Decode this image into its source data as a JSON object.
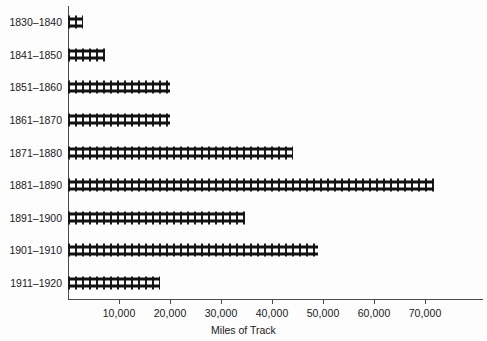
{
  "chart_data": {
    "type": "bar",
    "orientation": "horizontal",
    "title": "",
    "xlabel": "Miles of Track",
    "ylabel": "",
    "categories": [
      "1830–1840",
      "1841–1850",
      "1851–1860",
      "1861–1870",
      "1871–1880",
      "1881–1890",
      "1891–1900",
      "1901–1910",
      "1911–1920"
    ],
    "values": [
      3000,
      7250,
      20000,
      20000,
      44100,
      71800,
      34700,
      49000,
      18000
    ],
    "xlim": [
      0,
      77000
    ],
    "xticks": [
      10000,
      20000,
      30000,
      40000,
      50000,
      60000,
      70000
    ],
    "xtick_labels": [
      "10,000",
      "20,000",
      "30,000",
      "40,000",
      "50,000",
      "60,000",
      "70,000"
    ],
    "grid": false,
    "legend": null,
    "bar_style": "railroad-track",
    "bar_color": "#121212",
    "background_color": "#fdfdfd",
    "axis_color": "#4a4a4a"
  }
}
